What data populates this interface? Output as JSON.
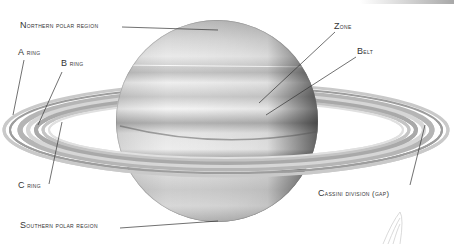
{
  "diagram": {
    "labels": [
      {
        "id": "northern-polar-region",
        "text": "Northern polar region",
        "x": 20,
        "y": 23
      },
      {
        "id": "a-ring",
        "text": "A ring",
        "x": 18,
        "y": 50
      },
      {
        "id": "b-ring",
        "text": "B ring",
        "x": 61,
        "y": 61
      },
      {
        "id": "zone",
        "text": "Zone",
        "x": 334,
        "y": 23
      },
      {
        "id": "belt",
        "text": "Belt",
        "x": 357,
        "y": 48
      },
      {
        "id": "c-ring",
        "text": "C ring",
        "x": 18,
        "y": 182
      },
      {
        "id": "cassini-division",
        "text": "Cassini division (gap)",
        "x": 318,
        "y": 190
      },
      {
        "id": "southern-polar-region",
        "text": "Southern polar region",
        "x": 20,
        "y": 222
      }
    ]
  }
}
